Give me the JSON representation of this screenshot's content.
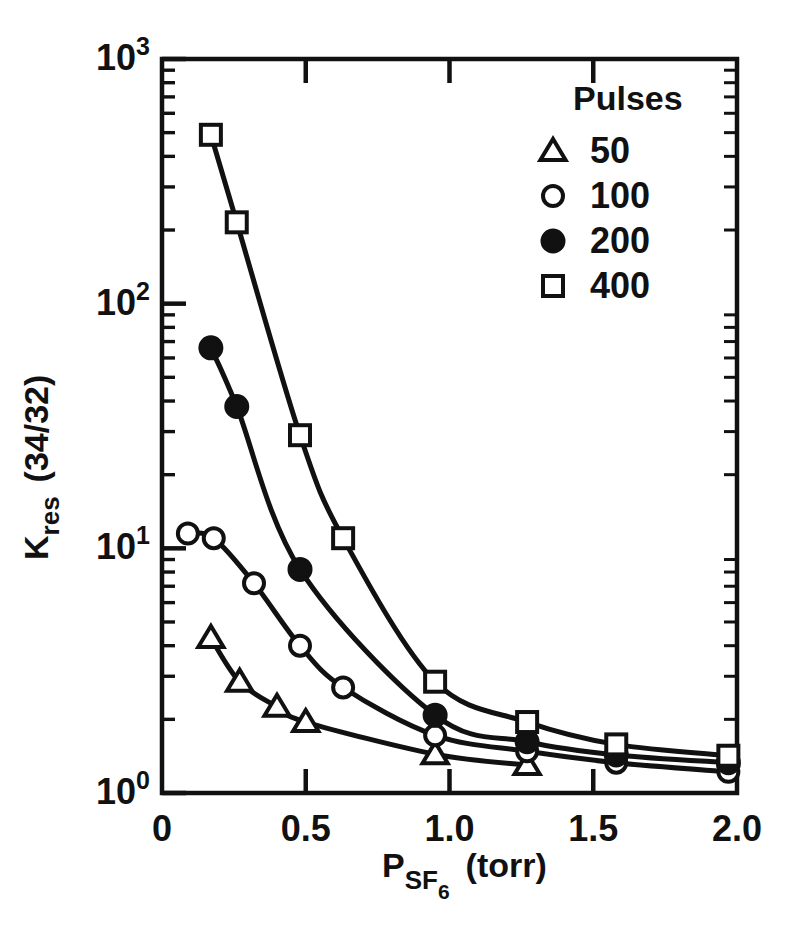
{
  "figure": {
    "background": "#ffffff",
    "ink": "#111111",
    "width": 795,
    "height": 936
  },
  "chart_data": {
    "type": "line",
    "title": "",
    "xlabel": "P_SF6 (torr)",
    "xlabel_parts": {
      "base": "P",
      "sub": "SF",
      "sub2": "6",
      "units": "(torr)"
    },
    "ylabel": "K_res (34/32)",
    "ylabel_parts": {
      "base": "K",
      "sub": "res",
      "rest": "(34/32)"
    },
    "xscale": "linear",
    "yscale": "log",
    "xlim": [
      0,
      2.0
    ],
    "ylim": [
      1,
      1000
    ],
    "xticks": [
      0,
      0.5,
      1.0,
      1.5,
      2.0
    ],
    "xticklabels": [
      "0",
      "0.5",
      "1.0",
      "1.5",
      "2.0"
    ],
    "yticks": [
      1,
      10,
      100,
      1000
    ],
    "yticklabels": [
      "10^0",
      "10^1",
      "10^2",
      "10^3"
    ],
    "ytick_exponents": [
      "0",
      "1",
      "2",
      "3"
    ],
    "ytick_mantissa": "10",
    "grid": false,
    "minor_ticks": true,
    "frame": "box",
    "tick_direction": "in",
    "legend": {
      "title": "Pulses",
      "position": "top-right",
      "entries": [
        {
          "marker": "triangle-open",
          "label": "50"
        },
        {
          "marker": "circle-open",
          "label": "100"
        },
        {
          "marker": "circle-filled",
          "label": "200"
        },
        {
          "marker": "square-open",
          "label": "400"
        }
      ]
    },
    "series": [
      {
        "name": "50",
        "marker": "triangle-open",
        "points": [
          {
            "x": 0.17,
            "y": 4.3
          },
          {
            "x": 0.27,
            "y": 2.85
          },
          {
            "x": 0.4,
            "y": 2.25
          },
          {
            "x": 0.5,
            "y": 1.95
          },
          {
            "x": 0.95,
            "y": 1.44
          },
          {
            "x": 1.27,
            "y": 1.3
          }
        ]
      },
      {
        "name": "100",
        "marker": "circle-open",
        "points": [
          {
            "x": 0.09,
            "y": 11.5
          },
          {
            "x": 0.18,
            "y": 11.0
          },
          {
            "x": 0.32,
            "y": 7.2
          },
          {
            "x": 0.48,
            "y": 4.0
          },
          {
            "x": 0.63,
            "y": 2.7
          },
          {
            "x": 0.95,
            "y": 1.72
          },
          {
            "x": 1.27,
            "y": 1.48
          },
          {
            "x": 1.58,
            "y": 1.33
          },
          {
            "x": 1.97,
            "y": 1.22
          }
        ]
      },
      {
        "name": "200",
        "marker": "circle-filled",
        "points": [
          {
            "x": 0.17,
            "y": 66
          },
          {
            "x": 0.26,
            "y": 38
          },
          {
            "x": 0.48,
            "y": 8.2
          },
          {
            "x": 0.95,
            "y": 2.08
          },
          {
            "x": 1.27,
            "y": 1.62
          },
          {
            "x": 1.58,
            "y": 1.43
          },
          {
            "x": 1.97,
            "y": 1.33
          }
        ]
      },
      {
        "name": "400",
        "marker": "square-open",
        "points": [
          {
            "x": 0.17,
            "y": 490
          },
          {
            "x": 0.26,
            "y": 215
          },
          {
            "x": 0.48,
            "y": 29
          },
          {
            "x": 0.63,
            "y": 11.0
          },
          {
            "x": 0.95,
            "y": 2.85
          },
          {
            "x": 1.27,
            "y": 1.95
          },
          {
            "x": 1.58,
            "y": 1.58
          },
          {
            "x": 1.97,
            "y": 1.42
          }
        ]
      }
    ]
  }
}
